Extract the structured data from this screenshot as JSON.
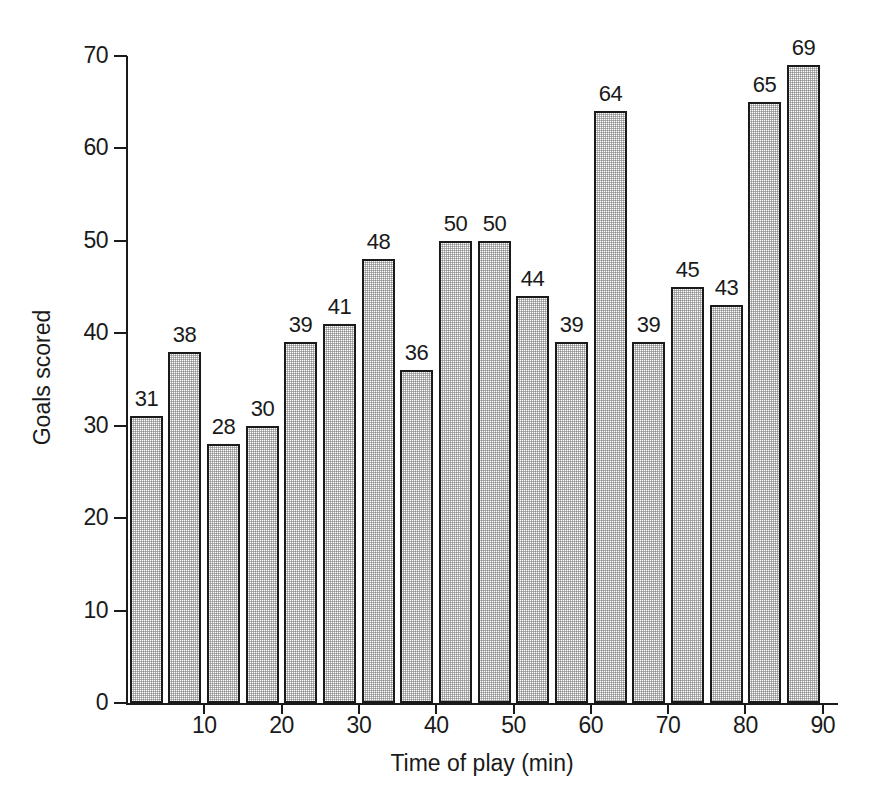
{
  "chart_data": {
    "type": "bar",
    "title": "",
    "xlabel": "Time of play (min)",
    "ylabel": "Goals scored",
    "x": [
      5,
      10,
      15,
      20,
      25,
      30,
      35,
      40,
      45,
      50,
      55,
      60,
      65,
      70,
      75,
      80,
      85,
      90
    ],
    "categories": [
      "0-5",
      "5-10",
      "10-15",
      "15-20",
      "20-25",
      "25-30",
      "30-35",
      "35-40",
      "40-45",
      "45-50",
      "50-55",
      "55-60",
      "60-65",
      "65-70",
      "70-75",
      "75-80",
      "80-85",
      "85-90"
    ],
    "values": [
      31,
      38,
      28,
      30,
      39,
      41,
      48,
      36,
      50,
      50,
      44,
      39,
      64,
      39,
      45,
      43,
      65,
      69
    ],
    "bar_labels": [
      "31",
      "38",
      "28",
      "30",
      "39",
      "41",
      "48",
      "36",
      "50",
      "50",
      "44",
      "39",
      "64",
      "39",
      "45",
      "43",
      "65",
      "69"
    ],
    "ylim": [
      0,
      70
    ],
    "xlim": [
      0,
      90
    ],
    "ytick_labels": [
      "0",
      "10",
      "20",
      "30",
      "40",
      "50",
      "60",
      "70"
    ],
    "ytick_values": [
      0,
      10,
      20,
      30,
      40,
      50,
      60,
      70
    ],
    "xtick_labels": [
      "10",
      "20",
      "30",
      "40",
      "50",
      "60",
      "70",
      "80",
      "90"
    ],
    "xtick_values": [
      10,
      20,
      30,
      40,
      50,
      60,
      70,
      80,
      90
    ],
    "grid": false,
    "legend": false,
    "bar_fill_color": "#e6e6e6",
    "bar_edge_color": "#1a1a1a",
    "background_color": "#ffffff"
  }
}
